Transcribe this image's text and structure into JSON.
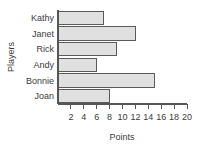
{
  "chart_data": {
    "type": "bar",
    "orientation": "horizontal",
    "title": "",
    "xlabel": "Points",
    "ylabel": "Players",
    "categories": [
      "Kathy",
      "Janet",
      "Rick",
      "Andy",
      "Bonnie",
      "Joan"
    ],
    "values": [
      7,
      12,
      9,
      6,
      15,
      8
    ],
    "xlim": [
      0,
      20
    ],
    "xticks": [
      2,
      4,
      6,
      8,
      10,
      12,
      14,
      16,
      18,
      20
    ],
    "xtick_labels": [
      "2",
      "4",
      "6",
      "8",
      "10",
      "12",
      "14",
      "16",
      "18",
      "20"
    ],
    "grid": false,
    "legend": false,
    "bar_fill_color": "#e0e0e0",
    "bar_edge_color": "#5a5a5a",
    "axis_color": "#555555",
    "text_color": "#3a3a3a",
    "background_color": "#ffffff"
  }
}
